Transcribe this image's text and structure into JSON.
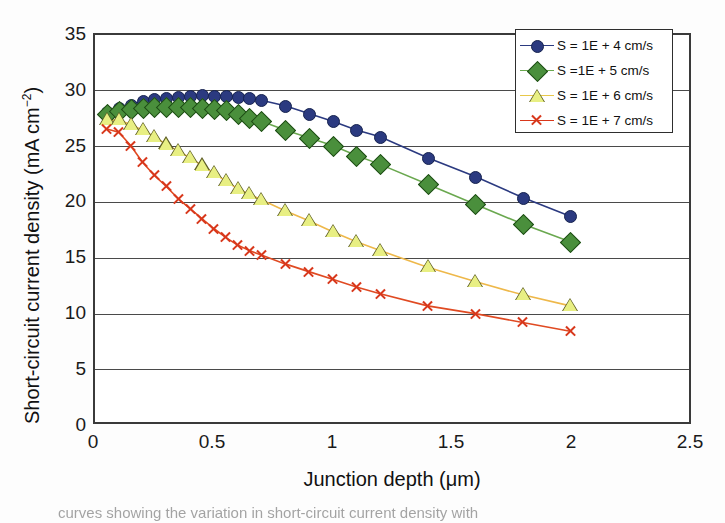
{
  "figure": {
    "caption_fragment": "curves showing the variation in short-circuit current density with"
  },
  "axes": {
    "xlabel": "Junction depth (μm)",
    "ylabel_main": "Short-circuit current density (mA cm",
    "ylabel_exponent": "−2",
    "ylabel_close": ")",
    "xticks": [
      "0",
      "0.5",
      "1",
      "1.5",
      "2",
      "2.5"
    ],
    "yticks": [
      "0",
      "5",
      "10",
      "15",
      "20",
      "25",
      "30",
      "35"
    ]
  },
  "legend": {
    "position": "top-right",
    "entries": [
      {
        "label": "S = 1E + 4 cm/s",
        "color": "#2b3a80",
        "marker": "circle-marker"
      },
      {
        "label": "S =1E + 5 cm/s",
        "color": "#4a8f3c",
        "marker": "diamond-marker"
      },
      {
        "label": "S = 1E + 6 cm/s",
        "color": "#e8c84a",
        "marker": "triangle-marker"
      },
      {
        "label": "S = 1E + 7 cm/s",
        "color": "#d8381c",
        "marker": "cross-marker"
      }
    ]
  },
  "chart_data": {
    "type": "line",
    "title": "",
    "xlabel": "Junction depth (μm)",
    "ylabel": "Short-circuit current density (mA cm−2)",
    "xlim": [
      0,
      2.5
    ],
    "ylim": [
      0,
      35
    ],
    "xticks": [
      0,
      0.5,
      1,
      1.5,
      2,
      2.5
    ],
    "yticks": [
      0,
      5,
      10,
      15,
      20,
      25,
      30,
      35
    ],
    "grid": "horizontal",
    "legend_position": "upper right",
    "series": [
      {
        "name": "S = 1E + 4 cm/s",
        "color": "#2b3a80",
        "marker": "circle",
        "x": [
          0.05,
          0.1,
          0.15,
          0.2,
          0.25,
          0.3,
          0.35,
          0.4,
          0.45,
          0.5,
          0.55,
          0.6,
          0.65,
          0.7,
          0.8,
          0.9,
          1.0,
          1.1,
          1.2,
          1.4,
          1.6,
          1.8,
          2.0
        ],
        "y": [
          28.0,
          28.4,
          28.7,
          29.0,
          29.2,
          29.3,
          29.4,
          29.5,
          29.6,
          29.5,
          29.5,
          29.4,
          29.3,
          29.1,
          28.6,
          27.9,
          27.2,
          26.4,
          25.8,
          23.9,
          22.2,
          20.3,
          18.6
        ]
      },
      {
        "name": "S =1E + 5 cm/s",
        "color": "#4a8f3c",
        "marker": "diamond",
        "x": [
          0.05,
          0.1,
          0.15,
          0.2,
          0.25,
          0.3,
          0.35,
          0.4,
          0.45,
          0.5,
          0.55,
          0.6,
          0.65,
          0.7,
          0.8,
          0.9,
          1.0,
          1.1,
          1.2,
          1.4,
          1.6,
          1.8,
          2.0
        ],
        "y": [
          27.9,
          28.1,
          28.3,
          28.4,
          28.5,
          28.5,
          28.5,
          28.5,
          28.4,
          28.3,
          28.2,
          27.9,
          27.5,
          27.2,
          26.4,
          25.7,
          25.0,
          24.1,
          23.3,
          21.5,
          19.7,
          17.9,
          16.3
        ]
      },
      {
        "name": "S = 1E + 6 cm/s",
        "color": "#e8c84a",
        "marker": "triangle",
        "x": [
          0.05,
          0.1,
          0.15,
          0.2,
          0.25,
          0.3,
          0.35,
          0.4,
          0.45,
          0.5,
          0.55,
          0.6,
          0.65,
          0.7,
          0.8,
          0.9,
          1.0,
          1.1,
          1.2,
          1.4,
          1.6,
          1.8,
          2.0
        ],
        "y": [
          27.3,
          27.3,
          26.9,
          26.4,
          25.8,
          25.1,
          24.5,
          23.9,
          23.2,
          22.5,
          21.8,
          21.1,
          20.6,
          20.1,
          19.1,
          18.2,
          17.2,
          16.3,
          15.5,
          14.0,
          12.7,
          11.5,
          10.5
        ]
      },
      {
        "name": "S = 1E + 7 cm/s",
        "color": "#d8381c",
        "marker": "cross",
        "x": [
          0.05,
          0.1,
          0.15,
          0.2,
          0.25,
          0.3,
          0.35,
          0.4,
          0.45,
          0.5,
          0.55,
          0.6,
          0.65,
          0.7,
          0.8,
          0.9,
          1.0,
          1.1,
          1.2,
          1.4,
          1.6,
          1.8,
          2.0
        ],
        "y": [
          26.5,
          26.2,
          25.0,
          23.5,
          22.3,
          21.3,
          20.2,
          19.3,
          18.4,
          17.5,
          16.7,
          16.0,
          15.5,
          15.1,
          14.3,
          13.6,
          12.9,
          12.2,
          11.6,
          10.5,
          9.8,
          9.0,
          8.2
        ]
      }
    ]
  }
}
